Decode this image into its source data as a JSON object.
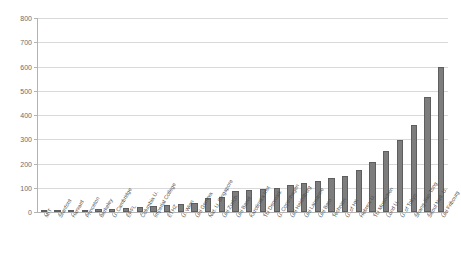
{
  "chart_data": {
    "type": "bar",
    "title": "",
    "subtitle": "",
    "xlabel": "",
    "ylabel": "",
    "ylim": [
      0,
      800
    ],
    "ytick_step": 100,
    "yticks": [
      0,
      100,
      200,
      300,
      400,
      500,
      600,
      700,
      800
    ],
    "grid": true,
    "legend": false,
    "bar_color": "#7d7d7d",
    "bar_border_color": "#5e5e5e",
    "grid_color": "#d9d9d9",
    "axis_color": "#b3b3b3",
    "categories": [
      "MIT",
      "Stanford",
      "Harvard",
      "Princeton",
      "Berkeley",
      "U. Cambridge",
      "EPFL",
      "Columbia U.",
      "Imperial College",
      "ETHZ",
      "U. Wien",
      "Uni Geneva",
      "Nat. U. Singapore",
      "Uni Zurich",
      "Uni Basel",
      "Karolinska Inst",
      "TU Denmark",
      "U. Copenhagen",
      "Uni Heidelberg",
      "Uni Lausanne",
      "Uni Bern",
      "Technion",
      "U. of HK",
      "Hebrew U.",
      "TU Muenchen",
      "Lund U.",
      "U. of Tokyo",
      "Shang Jiao Tong",
      "Seoul Natl. U.",
      "Uni Fribourg"
    ],
    "values": [
      4,
      6,
      7,
      9,
      11,
      14,
      17,
      20,
      24,
      28,
      33,
      38,
      58,
      62,
      88,
      92,
      96,
      100,
      112,
      120,
      128,
      140,
      148,
      172,
      205,
      250,
      295,
      360,
      475,
      600
    ],
    "note": "Bars sorted ascending left to right; two tallest bars reach approximately 600 and 735."
  },
  "axis": {
    "y_labels": [
      "0",
      "100",
      "200",
      "300",
      "400",
      "500",
      "600",
      "700",
      "800"
    ]
  }
}
